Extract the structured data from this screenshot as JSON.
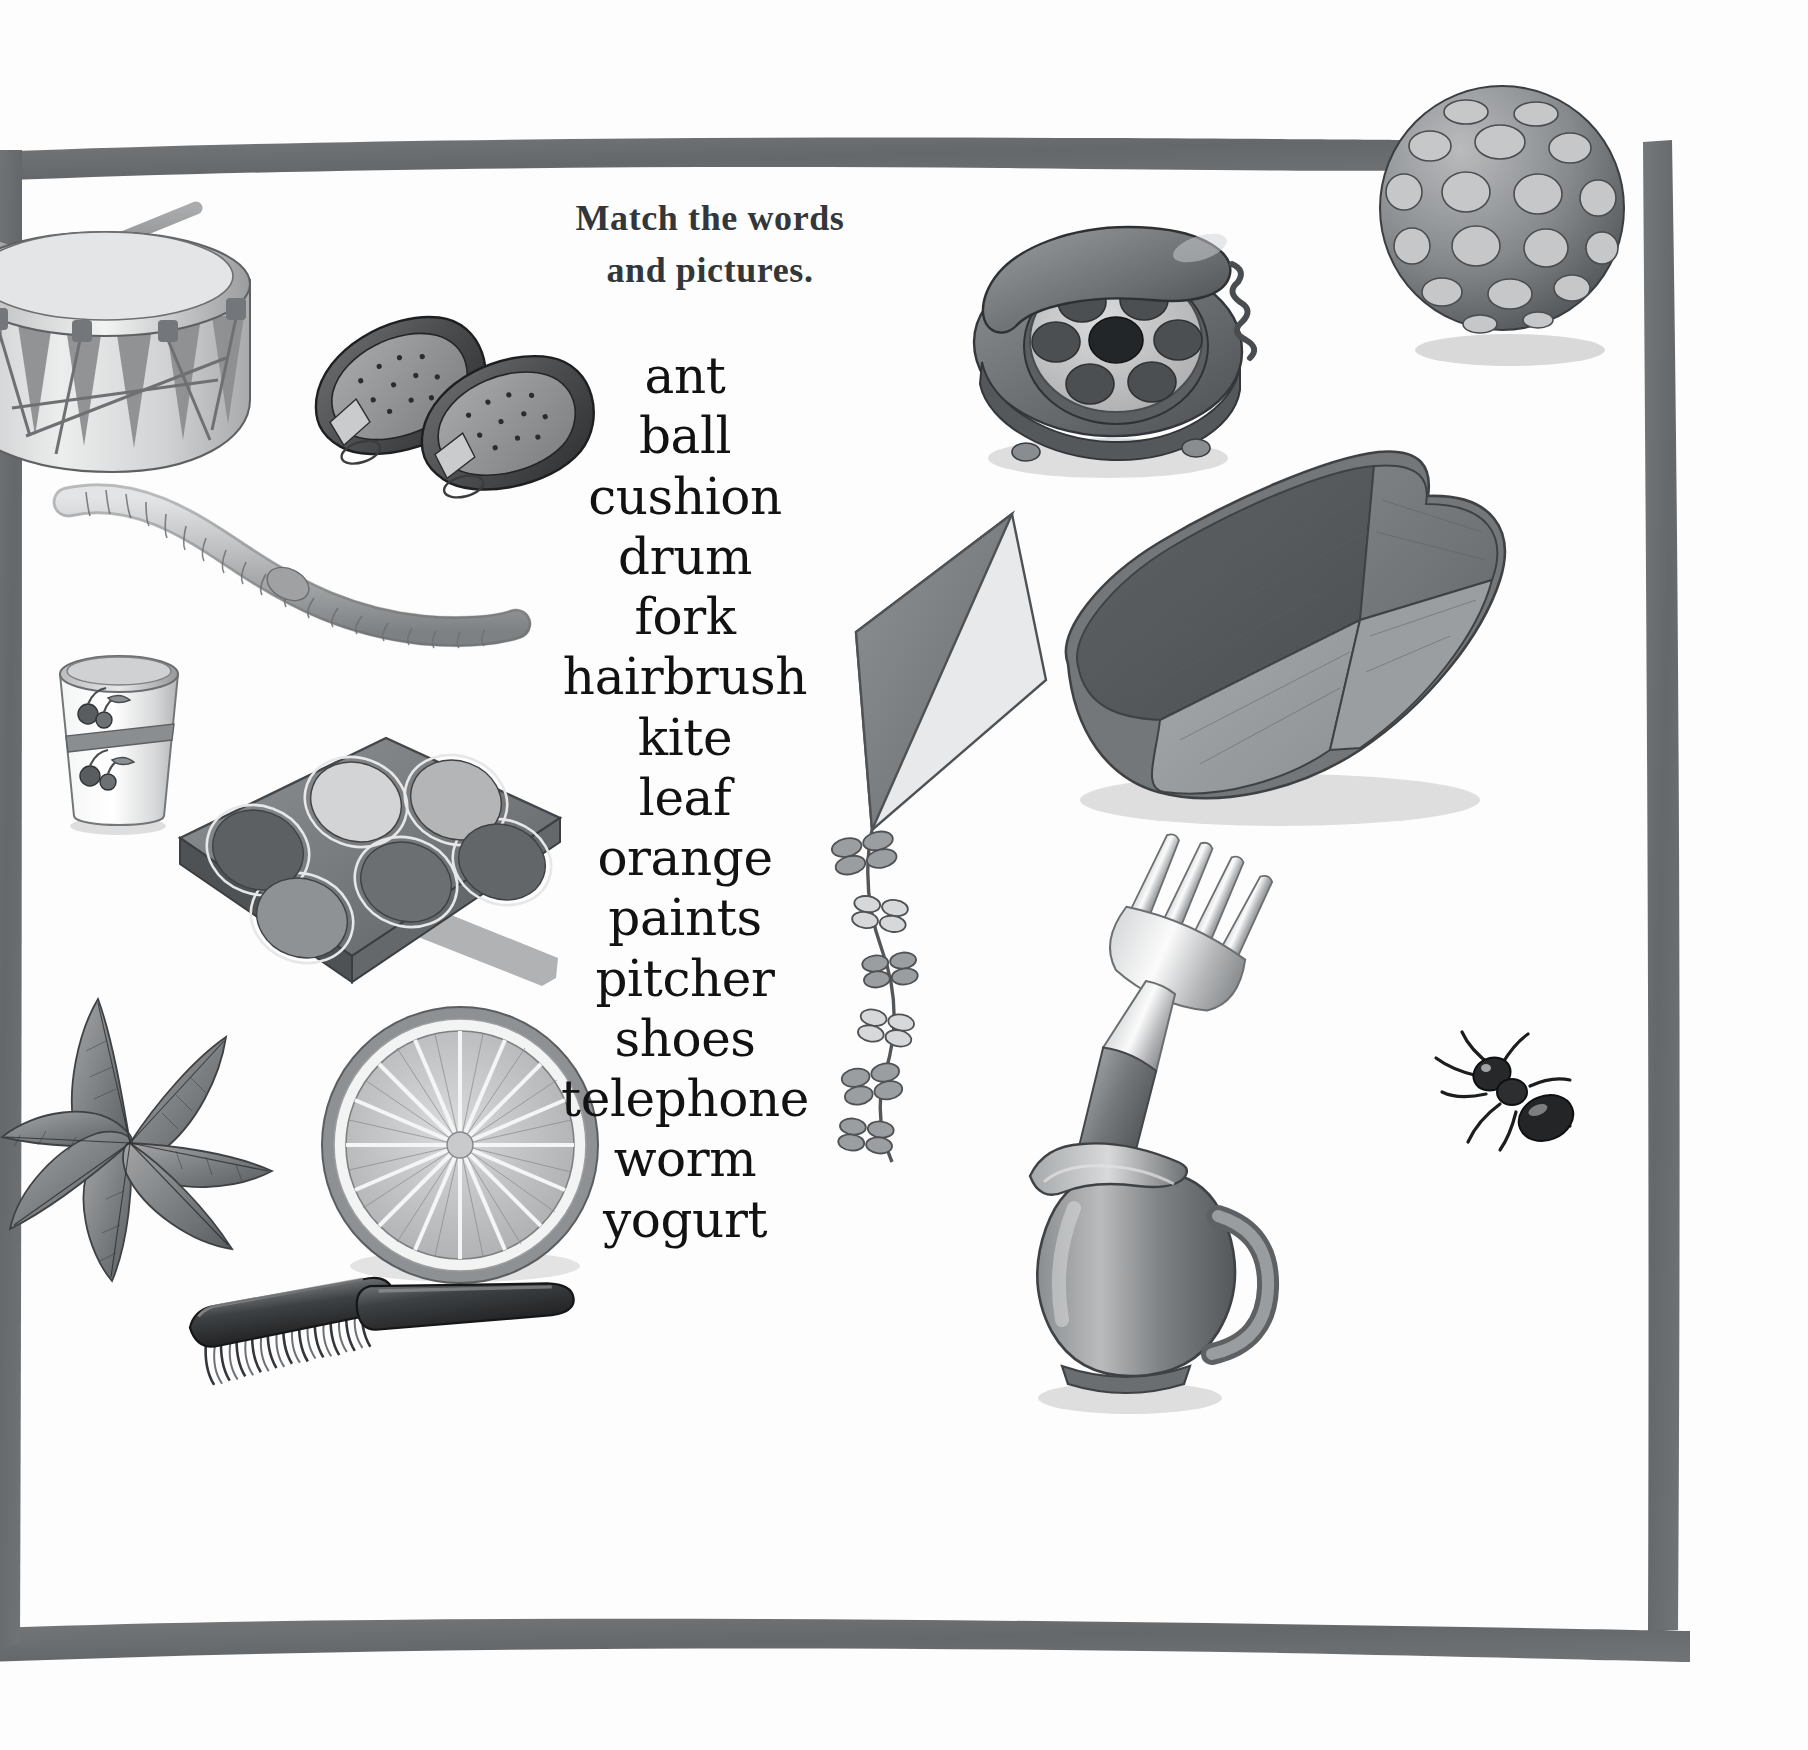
{
  "page": {
    "title_line1": "Match the words",
    "title_line2": "and pictures.",
    "border_color": "#6b6e70",
    "background_color": "#ffffff",
    "text_color": "#121212",
    "heading_color": "#33373a"
  },
  "word_list": [
    "ant",
    "ball",
    "cushion",
    "drum",
    "fork",
    "hairbrush",
    "kite",
    "leaf",
    "orange",
    "paints",
    "pitcher",
    "shoes",
    "telephone",
    "worm",
    "yogurt"
  ],
  "illustrations": [
    {
      "name": "drum",
      "label": "drum"
    },
    {
      "name": "shoes",
      "label": "shoes"
    },
    {
      "name": "telephone",
      "label": "telephone"
    },
    {
      "name": "ball",
      "label": "ball"
    },
    {
      "name": "worm",
      "label": "worm"
    },
    {
      "name": "cushion",
      "label": "cushion"
    },
    {
      "name": "yogurt",
      "label": "yogurt"
    },
    {
      "name": "paints",
      "label": "paints"
    },
    {
      "name": "kite",
      "label": "kite"
    },
    {
      "name": "fork",
      "label": "fork"
    },
    {
      "name": "ant",
      "label": "ant"
    },
    {
      "name": "leaf",
      "label": "leaf"
    },
    {
      "name": "orange",
      "label": "orange"
    },
    {
      "name": "pitcher",
      "label": "pitcher"
    },
    {
      "name": "hairbrush",
      "label": "hairbrush"
    }
  ]
}
